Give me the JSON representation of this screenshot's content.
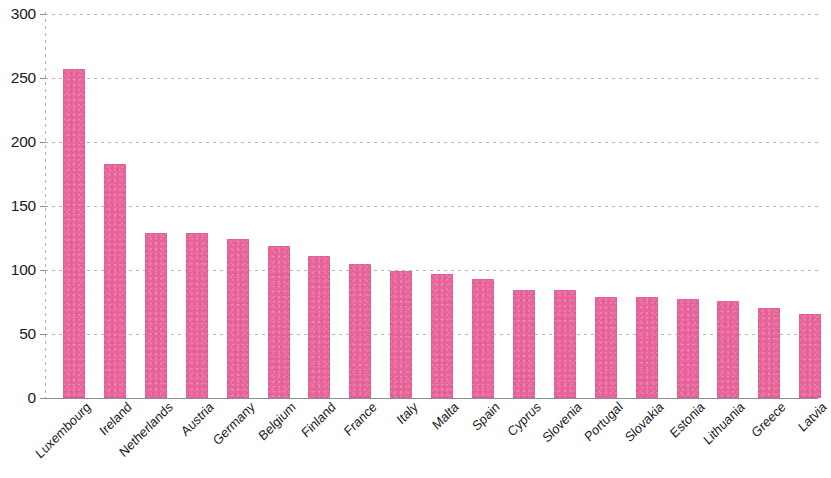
{
  "chart_data": {
    "type": "bar",
    "title": "",
    "subtitle": "",
    "xlabel": "",
    "ylabel": "",
    "ylim": [
      0,
      300
    ],
    "ytick_step": 50,
    "yticks": [
      300,
      250,
      200,
      150,
      100,
      50,
      0
    ],
    "ytick_labels": [
      "300",
      "250",
      "200",
      "150",
      "100",
      "50",
      "0"
    ],
    "grid": "horizontal-dashed",
    "legend": "none",
    "bar_color": "#e8649a",
    "categories": [
      "Luxembourg",
      "Ireland",
      "Netherlands",
      "Austria",
      "Germany",
      "Belgium",
      "Finland",
      "France",
      "Italy",
      "Malta",
      "Spain",
      "Cyprus",
      "Slovenia",
      "Portugal",
      "Slovakia",
      "Estonia",
      "Lithuania",
      "Greece",
      "Latvia"
    ],
    "values": [
      257,
      183,
      129,
      129,
      124,
      119,
      111,
      105,
      99,
      97,
      93,
      84,
      84,
      79,
      79,
      77,
      76,
      70,
      66
    ]
  },
  "axis": {
    "y_ticks": [
      "300",
      "250",
      "200",
      "150",
      "100",
      "50",
      "0"
    ]
  }
}
